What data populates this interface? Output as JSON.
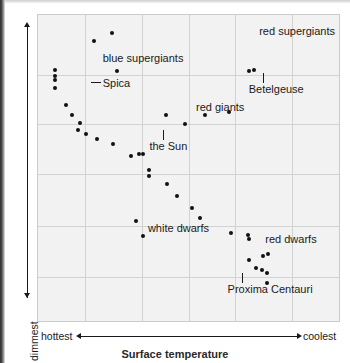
{
  "chart_data": {
    "type": "scatter",
    "xlabel": "Surface temperature",
    "ylabel": "Luminosity",
    "x_axis": {
      "label": "Surface temperature",
      "left_tick": "hottest",
      "right_tick": "coolest",
      "direction": "decreasing",
      "arrow": "double",
      "ticks": []
    },
    "y_axis": {
      "label": "Luminosity",
      "top_tick": "brightest",
      "bottom_tick": "dimmest",
      "direction": "increasing",
      "arrow": "double",
      "ticks": []
    },
    "grid": {
      "visible": true,
      "vertical_fractions": [
        0.155,
        0.345,
        0.5,
        0.655,
        0.845
      ],
      "horizontal_fractions": [
        0.195,
        0.355,
        0.52,
        0.69,
        0.855
      ],
      "color": "#d2d2d2",
      "plot_background": "#f2f2f2"
    },
    "legend": {
      "position": "none",
      "entries": []
    },
    "annotations": [
      {
        "name": "blue-supergiants",
        "text": "blue supergiants",
        "x_frac": 0.215,
        "y_frac": 0.125,
        "anchor": "left"
      },
      {
        "name": "red-supergiants",
        "text": "red supergiants",
        "x_frac": 0.735,
        "y_frac": 0.035,
        "anchor": "left"
      },
      {
        "name": "spica",
        "text": "Spica",
        "x_frac": 0.215,
        "y_frac": 0.205,
        "anchor": "left",
        "leader": "horizontal"
      },
      {
        "name": "betelgeuse",
        "text": "Betelgeuse",
        "x_frac": 0.7,
        "y_frac": 0.225,
        "anchor": "left",
        "leader": "vertical"
      },
      {
        "name": "red-giants",
        "text": "red giants",
        "x_frac": 0.525,
        "y_frac": 0.285,
        "anchor": "left"
      },
      {
        "name": "the-sun",
        "text": "the Sun",
        "x_frac": 0.37,
        "y_frac": 0.41,
        "anchor": "left",
        "leader": "vertical"
      },
      {
        "name": "white-dwarfs",
        "text": "white dwarfs",
        "x_frac": 0.365,
        "y_frac": 0.68,
        "anchor": "left"
      },
      {
        "name": "red-dwarfs",
        "text": "red dwarfs",
        "x_frac": 0.755,
        "y_frac": 0.715,
        "anchor": "left"
      },
      {
        "name": "proxima-centauri",
        "text": "Proxima Centauri",
        "x_frac": 0.63,
        "y_frac": 0.88,
        "anchor": "left",
        "leader": "vertical"
      }
    ],
    "points": [
      {
        "x_frac": 0.185,
        "y_frac": 0.085
      },
      {
        "x_frac": 0.245,
        "y_frac": 0.058
      },
      {
        "x_frac": 0.055,
        "y_frac": 0.178
      },
      {
        "x_frac": 0.055,
        "y_frac": 0.2
      },
      {
        "x_frac": 0.055,
        "y_frac": 0.213
      },
      {
        "x_frac": 0.055,
        "y_frac": 0.238
      },
      {
        "x_frac": 0.262,
        "y_frac": 0.182
      },
      {
        "x_frac": 0.092,
        "y_frac": 0.295
      },
      {
        "x_frac": 0.112,
        "y_frac": 0.327
      },
      {
        "x_frac": 0.14,
        "y_frac": 0.353
      },
      {
        "x_frac": 0.132,
        "y_frac": 0.376
      },
      {
        "x_frac": 0.16,
        "y_frac": 0.388
      },
      {
        "x_frac": 0.195,
        "y_frac": 0.406
      },
      {
        "x_frac": 0.25,
        "y_frac": 0.42
      },
      {
        "x_frac": 0.31,
        "y_frac": 0.46
      },
      {
        "x_frac": 0.337,
        "y_frac": 0.455
      },
      {
        "x_frac": 0.35,
        "y_frac": 0.453
      },
      {
        "x_frac": 0.368,
        "y_frac": 0.505
      },
      {
        "x_frac": 0.368,
        "y_frac": 0.525
      },
      {
        "x_frac": 0.428,
        "y_frac": 0.552
      },
      {
        "x_frac": 0.425,
        "y_frac": 0.325
      },
      {
        "x_frac": 0.487,
        "y_frac": 0.355
      },
      {
        "x_frac": 0.555,
        "y_frac": 0.325
      },
      {
        "x_frac": 0.635,
        "y_frac": 0.318
      },
      {
        "x_frac": 0.463,
        "y_frac": 0.592
      },
      {
        "x_frac": 0.51,
        "y_frac": 0.632
      },
      {
        "x_frac": 0.537,
        "y_frac": 0.663
      },
      {
        "x_frac": 0.7,
        "y_frac": 0.183
      },
      {
        "x_frac": 0.718,
        "y_frac": 0.18
      },
      {
        "x_frac": 0.325,
        "y_frac": 0.672
      },
      {
        "x_frac": 0.35,
        "y_frac": 0.722
      },
      {
        "x_frac": 0.64,
        "y_frac": 0.712
      },
      {
        "x_frac": 0.697,
        "y_frac": 0.718
      },
      {
        "x_frac": 0.702,
        "y_frac": 0.732
      },
      {
        "x_frac": 0.748,
        "y_frac": 0.788
      },
      {
        "x_frac": 0.763,
        "y_frac": 0.782
      },
      {
        "x_frac": 0.7,
        "y_frac": 0.802
      },
      {
        "x_frac": 0.725,
        "y_frac": 0.828
      },
      {
        "x_frac": 0.745,
        "y_frac": 0.833
      },
      {
        "x_frac": 0.762,
        "y_frac": 0.843
      },
      {
        "x_frac": 0.76,
        "y_frac": 0.875
      }
    ]
  }
}
